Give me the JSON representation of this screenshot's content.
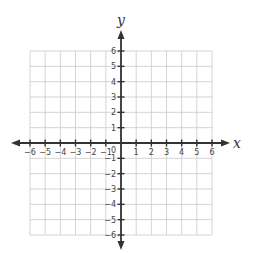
{
  "chart_data": {
    "type": "scatter",
    "title": "",
    "subtitle": "",
    "xlabel": "x",
    "ylabel": "y",
    "xlim": [
      -6,
      6
    ],
    "ylim": [
      -6,
      6
    ],
    "grid": true,
    "legend": null,
    "x_ticks": [
      -6,
      -5,
      -4,
      -3,
      -2,
      -1,
      1,
      2,
      3,
      4,
      5,
      6
    ],
    "y_ticks": [
      -6,
      -5,
      -4,
      -3,
      -2,
      -1,
      1,
      2,
      3,
      4,
      5,
      6
    ],
    "x_tick_labels": [
      "−6",
      "−5",
      "−4",
      "−3",
      "−2",
      "−1",
      "1",
      "2",
      "3",
      "4",
      "5",
      "6"
    ],
    "y_tick_labels": [
      "−6",
      "−5",
      "−4",
      "−3",
      "−2",
      "−1",
      "1",
      "2",
      "3",
      "4",
      "5",
      "6"
    ],
    "origin_label": "0",
    "series": [],
    "annotations": [
      "blank coordinate plane with arrows on both axes"
    ]
  },
  "layout": {
    "origin_px": [
      121,
      143
    ],
    "cell_px": 15.2,
    "grid_left": 30,
    "grid_right": 212,
    "grid_top": 51,
    "grid_bottom": 235,
    "x_arrow_left": 11,
    "x_arrow_right": 230,
    "y_arrow_top": 30,
    "y_arrow_bottom": 250
  },
  "colors": {
    "grid": "#c9c9c9",
    "axis": "#333333",
    "text": "#444444",
    "background": "#ffffff"
  }
}
